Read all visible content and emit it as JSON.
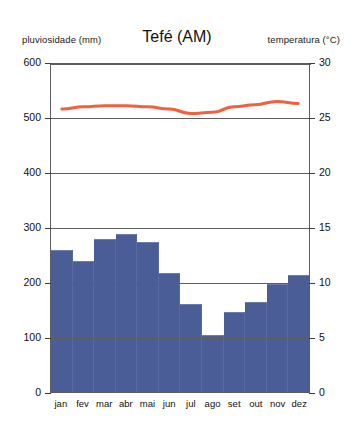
{
  "header": {
    "title": "Tefé (AM)",
    "left_axis_caption": "pluviosidade (mm)",
    "right_axis_caption": "temperatura (°C)"
  },
  "colors": {
    "bar": "#4a5d96",
    "line": "#f2603c",
    "axis": "#5d5d5d",
    "background": "#ffffff"
  },
  "axes": {
    "left_ticks": [
      "0",
      "100",
      "200",
      "300",
      "400",
      "500",
      "600"
    ],
    "right_ticks": [
      "0",
      "5",
      "10",
      "15",
      "20",
      "25",
      "30"
    ]
  },
  "chart_data": {
    "type": "bar",
    "title": "Tefé (AM)",
    "xlabel": "",
    "ylabel": "pluviosidade (mm)",
    "y2label": "temperatura (°C)",
    "ylim": [
      0,
      600
    ],
    "y2lim": [
      0,
      30
    ],
    "grid": true,
    "legend": "none",
    "categories": [
      "jan",
      "fev",
      "mar",
      "abr",
      "mai",
      "jun",
      "jul",
      "ago",
      "set",
      "out",
      "nov",
      "dez"
    ],
    "series": [
      {
        "name": "pluviosidade (mm)",
        "type": "bar",
        "axis": "left",
        "color": "#4a5d96",
        "values": [
          258,
          238,
          278,
          287,
          272,
          217,
          160,
          103,
          145,
          163,
          196,
          213
        ]
      },
      {
        "name": "temperatura (°C)",
        "type": "line",
        "axis": "right",
        "color": "#f2603c",
        "values": [
          25.8,
          26.0,
          26.1,
          26.1,
          26.0,
          25.8,
          25.4,
          25.5,
          26.0,
          26.2,
          26.5,
          26.3
        ]
      }
    ]
  }
}
